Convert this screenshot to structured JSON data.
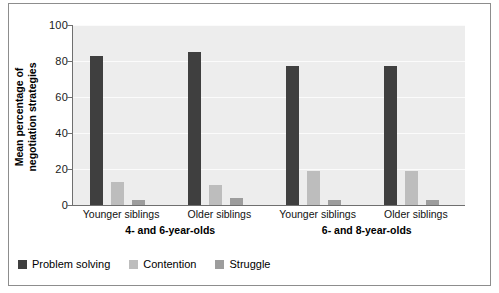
{
  "chart_data": {
    "type": "bar",
    "title": "",
    "xlabel": "",
    "ylabel_line1": "Mean percentage of",
    "ylabel_line2": "negotiation strategies",
    "ylim": [
      0,
      100
    ],
    "yticks": [
      0,
      20,
      40,
      60,
      80,
      100
    ],
    "ytick_labels": [
      "0",
      "20",
      "40",
      "60",
      "80",
      "100"
    ],
    "grid": true,
    "legend_position": "bottom-left",
    "categories": [
      "Younger siblings",
      "Older siblings",
      "Younger siblings",
      "Older siblings"
    ],
    "group_labels": [
      "4- and 6-year-olds",
      "6- and 8-year-olds"
    ],
    "series": [
      {
        "name": "Problem solving",
        "color": "#3f3f3f",
        "values": [
          83,
          85,
          77,
          77
        ]
      },
      {
        "name": "Contention",
        "color": "#bdbdbd",
        "values": [
          13,
          11,
          19,
          19
        ]
      },
      {
        "name": "Struggle",
        "color": "#9d9d9d",
        "values": [
          3,
          4,
          3,
          3
        ]
      }
    ]
  },
  "legend": {
    "items": [
      {
        "label": "Problem solving",
        "color": "#3f3f3f"
      },
      {
        "label": "Contention",
        "color": "#bdbdbd"
      },
      {
        "label": "Struggle",
        "color": "#9d9d9d"
      }
    ]
  }
}
